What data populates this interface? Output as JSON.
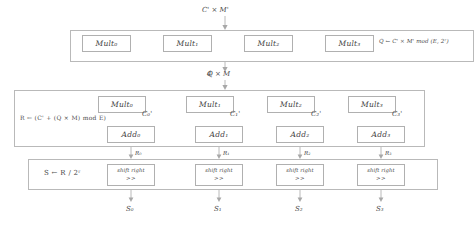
{
  "diagram": {
    "top_input": "C' × M'",
    "stage1_to_stage2": "Q × M",
    "stages": [
      {
        "id": "stage-multiply",
        "formula": "Q ← C' × M' mod (E, 2ʳ)",
        "units": [
          "Mult₀",
          "Mult₁",
          "Mult₂",
          "Mult₃"
        ]
      },
      {
        "id": "stage-add",
        "formula": "R ← (C' + (Q × M) mod E)",
        "mult_units": [
          "Mult₀",
          "Mult₁",
          "Mult₂",
          "Mult₃"
        ],
        "add_units": [
          "Add₀",
          "Add₁",
          "Add₂",
          "Add₃"
        ],
        "side_inputs": [
          "C₀'",
          "C₁'",
          "C₂'",
          "C₃'"
        ]
      },
      {
        "id": "stage-shift",
        "formula": "S ← R / 2ʳ",
        "unit_label": "shift right",
        "unit_op": ">>",
        "inputs": [
          "R₀",
          "R₁",
          "R₂",
          "R₃"
        ],
        "outputs": [
          "S₀",
          "S₁",
          "S₂",
          "S₃"
        ]
      }
    ]
  }
}
